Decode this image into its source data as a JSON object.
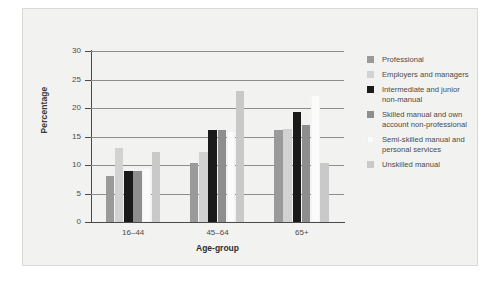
{
  "chart_data": {
    "type": "bar",
    "title": "",
    "xlabel": "Age-group",
    "ylabel": "Percentage",
    "ylim": [
      0,
      30
    ],
    "yticks": [
      0,
      5,
      10,
      15,
      20,
      25,
      30
    ],
    "ytick_labels": [
      "0",
      "5",
      "10",
      "15",
      "20",
      "25",
      "30"
    ],
    "grid": true,
    "legend_position": "right",
    "categories": [
      "16–44",
      "45–64",
      "65+"
    ],
    "series": [
      {
        "name": "Professional",
        "color": "#9a9a9a",
        "values": [
          8.0,
          10.3,
          16.1
        ]
      },
      {
        "name": "Employers and managers",
        "color": "#d2d2d2",
        "values": [
          13.0,
          12.2,
          16.4
        ]
      },
      {
        "name": "Intermediate and junior non-manual",
        "color": "#1a1a1a",
        "values": [
          9.0,
          16.1,
          19.3
        ]
      },
      {
        "name": "Skilled manual and own account non-professional",
        "color": "#8e8e8e",
        "values": [
          9.0,
          16.1,
          17.1
        ]
      },
      {
        "name": "Semi-skilled manual and personal services",
        "color": "#fbfbfb",
        "values": [
          9.4,
          15.9,
          22.3
        ]
      },
      {
        "name": "Unskilled manual",
        "color": "#c9c9c9",
        "values": [
          12.2,
          23.0,
          10.3
        ]
      }
    ]
  },
  "legend": {
    "items": [
      {
        "label": "Professional"
      },
      {
        "label": "Employers and managers"
      },
      {
        "label": "Intermediate and junior\nnon-manual"
      },
      {
        "label": "Skilled manual and own\naccount non-professional"
      },
      {
        "label": "Semi-skilled manual and\npersonal services"
      },
      {
        "label": "Unskilled manual"
      }
    ]
  }
}
